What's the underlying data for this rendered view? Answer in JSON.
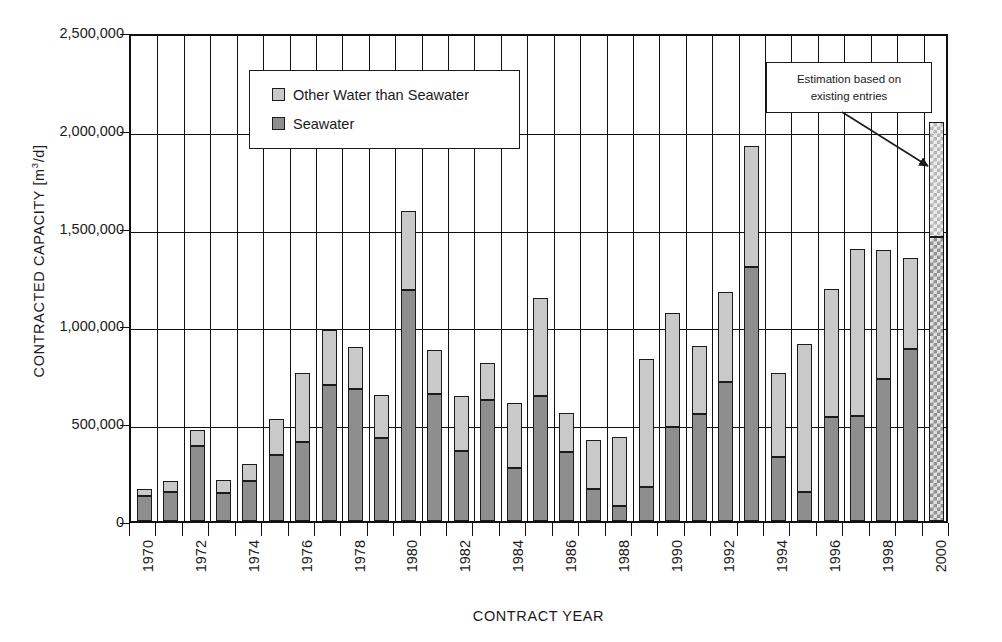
{
  "chart_data": {
    "type": "bar",
    "title": "",
    "xlabel": "CONTRACT YEAR",
    "ylabel": "CONTRACTED CAPACITY [m³/d]",
    "ylabel_prefix": "CONTRACTED CAPACITY [m",
    "ylabel_exp": "3",
    "ylabel_suffix": "/d]",
    "stacked": true,
    "grid": true,
    "ylim": [
      0,
      2500000
    ],
    "ytick_labels": [
      "2,500,000",
      "2,000,000",
      "1,500,000",
      "1,000,000",
      "500,000",
      "0"
    ],
    "ytick_values": [
      2500000,
      2000000,
      1500000,
      1000000,
      500000,
      0
    ],
    "xtick_labels": [
      "1970",
      "1972",
      "1974",
      "1976",
      "1978",
      "1980",
      "1982",
      "1984",
      "1986",
      "1988",
      "1990",
      "1992",
      "1994",
      "1996",
      "1998",
      "2000"
    ],
    "categories": [
      "1970",
      "1971",
      "1972",
      "1973",
      "1974",
      "1975",
      "1976",
      "1977",
      "1978",
      "1979",
      "1980",
      "1981",
      "1982",
      "1983",
      "1984",
      "1985",
      "1986",
      "1987",
      "1988",
      "1989",
      "1990",
      "1991",
      "1992",
      "1993",
      "1994",
      "1995",
      "1996",
      "1997",
      "1998",
      "1999",
      "2000"
    ],
    "series": [
      {
        "name": "Seawater",
        "color": "#8e8e8e",
        "values": [
          130000,
          150000,
          385000,
          145000,
          205000,
          340000,
          405000,
          695000,
          675000,
          425000,
          1180000,
          650000,
          360000,
          620000,
          270000,
          640000,
          355000,
          165000,
          75000,
          175000,
          480000,
          545000,
          710000,
          1300000,
          325000,
          150000,
          530000,
          535000,
          725000,
          880000,
          1450000
        ]
      },
      {
        "name": "Other Water than Seawater",
        "color": "#c9c9c9",
        "values": [
          35000,
          55000,
          80000,
          65000,
          85000,
          180000,
          350000,
          280000,
          215000,
          220000,
          405000,
          225000,
          280000,
          190000,
          335000,
          500000,
          195000,
          250000,
          355000,
          655000,
          585000,
          350000,
          460000,
          615000,
          430000,
          755000,
          655000,
          855000,
          660000,
          465000,
          590000
        ]
      }
    ],
    "totals": [
      165000,
      205000,
      465000,
      210000,
      290000,
      520000,
      755000,
      975000,
      890000,
      645000,
      1585000,
      875000,
      640000,
      810000,
      605000,
      1140000,
      550000,
      415000,
      430000,
      830000,
      1065000,
      895000,
      1170000,
      1915000,
      755000,
      905000,
      1185000,
      1390000,
      1385000,
      1345000,
      2040000
    ],
    "estimated_categories": [
      "2000"
    ]
  },
  "legend": {
    "position": "inside-top-left",
    "items": [
      {
        "label": "Other Water than Seawater",
        "swatch": "other"
      },
      {
        "label": "Seawater",
        "swatch": "sea"
      }
    ]
  },
  "annotation": {
    "line1": "Estimation based on",
    "line2": "existing entries",
    "points_to": "2000"
  }
}
